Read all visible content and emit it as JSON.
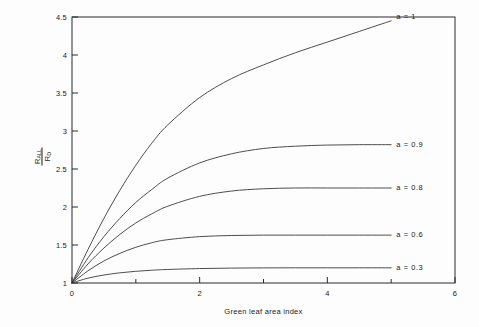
{
  "chart_data": {
    "type": "line",
    "title": "",
    "subtitle": "",
    "xlabel": "Green leaf area index",
    "ylabel_numerator": "R",
    "ylabel_numerator_sub": "ALL",
    "ylabel_denominator": "R",
    "ylabel_denominator_sub": "D",
    "ylabel_plain": "R_ALL / R_D",
    "xlim": [
      0,
      6
    ],
    "ylim": [
      1,
      4.5
    ],
    "xticks": [
      0,
      2,
      4,
      6
    ],
    "xtick_labels": [
      "0",
      "2",
      "4",
      "6"
    ],
    "xminor_ticks": [
      1,
      3,
      5
    ],
    "yticks": [
      1,
      1.5,
      2,
      2.5,
      3,
      3.5,
      4,
      4.5
    ],
    "ytick_labels": [
      "1",
      "1.5",
      "2",
      "2.5",
      "3",
      "3.5",
      "4",
      "4.5"
    ],
    "grid": false,
    "legend_position": "right-inline-annotations",
    "x": [
      0,
      0.25,
      0.5,
      0.75,
      1,
      1.25,
      1.5,
      2,
      2.5,
      3,
      3.5,
      4,
      4.5,
      5
    ],
    "series": [
      {
        "name": "a = 1",
        "label": "a  =  1",
        "color": "#3a3a3a",
        "values": [
          1.0,
          1.44,
          1.85,
          2.22,
          2.55,
          2.84,
          3.08,
          3.44,
          3.69,
          3.87,
          4.03,
          4.17,
          4.31,
          4.45
        ],
        "label_x": 5.05,
        "label_y": 4.5
      },
      {
        "name": "a = 0.9",
        "label": "a  =  0.9",
        "color": "#3a3a3a",
        "values": [
          1.0,
          1.33,
          1.61,
          1.85,
          2.06,
          2.23,
          2.38,
          2.58,
          2.7,
          2.77,
          2.8,
          2.815,
          2.82,
          2.82
        ],
        "label_x": 5.05,
        "label_y": 2.82
      },
      {
        "name": "a = 0.8",
        "label": "a  =  0.8",
        "color": "#3a3a3a",
        "values": [
          1.0,
          1.25,
          1.46,
          1.64,
          1.79,
          1.91,
          2.01,
          2.14,
          2.21,
          2.24,
          2.25,
          2.25,
          2.25,
          2.25
        ],
        "label_x": 5.05,
        "label_y": 2.25
      },
      {
        "name": "a = 0.6",
        "label": "a  =  0.6",
        "color": "#3a3a3a",
        "values": [
          1.0,
          1.16,
          1.29,
          1.39,
          1.47,
          1.53,
          1.57,
          1.61,
          1.625,
          1.63,
          1.63,
          1.63,
          1.63,
          1.63
        ],
        "label_x": 5.05,
        "label_y": 1.63
      },
      {
        "name": "a = 0.3",
        "label": "a  =  0.3",
        "color": "#3a3a3a",
        "values": [
          1.0,
          1.064,
          1.105,
          1.134,
          1.154,
          1.168,
          1.178,
          1.19,
          1.196,
          1.199,
          1.2,
          1.2,
          1.2,
          1.2
        ],
        "label_x": 5.05,
        "label_y": 1.2
      }
    ]
  },
  "axes": {
    "x_title": "Green leaf area index"
  }
}
